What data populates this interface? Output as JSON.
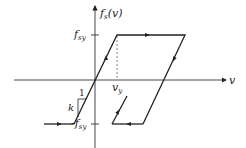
{
  "diagram": {
    "y_axis_label": "f_s(v)",
    "y_axis_label_main": "f",
    "y_axis_label_sub": "s",
    "y_axis_label_arg": "(v)",
    "x_axis_label": "v",
    "tick_pos_main": "f",
    "tick_pos_sub": "sy",
    "tick_neg_main": "-f",
    "tick_neg_sub": "sy",
    "yield_disp_main": "v",
    "yield_disp_sub": "y",
    "slope_run_label": "1",
    "slope_rise_label": "k",
    "line_color": "#222222"
  }
}
